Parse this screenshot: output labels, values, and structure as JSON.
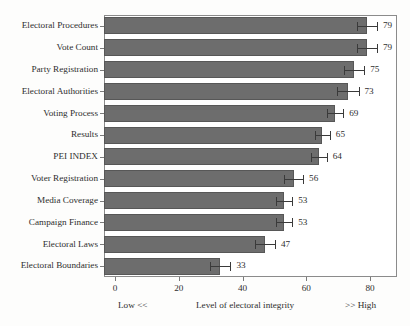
{
  "chart_data": {
    "type": "bar",
    "orientation": "horizontal",
    "title": "",
    "subtitle": "",
    "xlabel": "Level of electoral integrity",
    "ylabel": "",
    "xlim": [
      0,
      85
    ],
    "xticks": [
      0,
      20,
      40,
      60,
      80
    ],
    "xtick_labels": [
      "0",
      "20",
      "40",
      "60",
      "80"
    ],
    "grid": false,
    "legend": null,
    "categories": [
      "Electoral Procedures",
      "Vote Count",
      "Party Registration",
      "Electoral Authorities",
      "Voting Process",
      "Results",
      "PEI INDEX",
      "Voter Registration",
      "Media Coverage",
      "Campaign Finance",
      "Electoral Laws",
      "Electoral Boundaries"
    ],
    "values": [
      79,
      79,
      75,
      73,
      69,
      65,
      64,
      56,
      53,
      53,
      47,
      33
    ],
    "value_labels": [
      "79",
      "79",
      "75",
      "73",
      "69",
      "65",
      "64",
      "56",
      "53",
      "53",
      "47",
      "33"
    ],
    "errors": [
      3.2,
      3.2,
      3.2,
      3.4,
      2.6,
      2.4,
      2.4,
      3.0,
      2.6,
      2.6,
      3.2,
      3.2
    ],
    "bar_color": "#6d6d6d",
    "bar_edge_color": "#575757",
    "error_color": "#3a3a3a",
    "axis_color": "#8b8b8b",
    "background_color": "#ffffff",
    "annotations": {
      "low": "Low <<",
      "axis_caption": "Level of electoral integrity",
      "high": ">> High"
    }
  }
}
